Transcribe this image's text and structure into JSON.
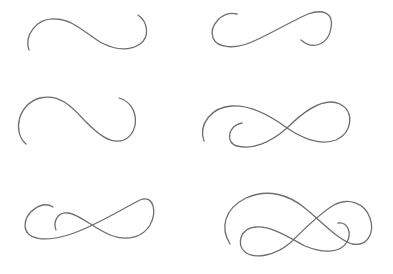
{
  "canvas": {
    "width": 393,
    "height": 274,
    "background": "#ffffff",
    "stroke_color": "#6e6e6e",
    "stroke_width": 1.3
  },
  "flourishes": [
    {
      "name": "flourish-1-s-curve",
      "paths": [
        "M29,50 C24,36 36,18 55,19 C72,19 84,32 100,42 C115,50 128,52 140,44 C150,37 148,22 138,15"
      ]
    },
    {
      "name": "flourish-2-open-loop",
      "paths": [
        "M237,14 C222,10 209,26 213,38 C217,48 235,50 254,41 C272,33 290,22 308,14 C322,9 334,12 331,28 C329,42 315,52 301,40"
      ]
    },
    {
      "name": "flourish-3-wide-s-curve",
      "paths": [
        "M26,144 C12,132 18,104 40,98 C60,93 73,108 85,121 C97,133 110,145 124,140 C140,133 140,104 119,98"
      ]
    },
    {
      "name": "flourish-4-infinity-with-curl",
      "paths": [
        "M204,141 C198,124 212,107 232,106 C252,105 272,117 287,128 C302,138 320,146 336,140 C352,133 355,112 340,104 C325,97 305,110 287,128 C270,143 252,150 237,146 C225,143 228,125 242,123"
      ]
    },
    {
      "name": "flourish-5-infinity-with-inner-curl",
      "paths": [
        "M53,207 C42,200 25,212 25,226 C26,240 45,242 68,235 C92,228 120,210 140,200 C154,194 157,212 150,225 C143,237 128,241 113,236 C95,230 80,214 68,213 C57,212 53,222 56,230"
      ]
    },
    {
      "name": "flourish-6-double-loop",
      "paths": [
        "M230,244 C220,228 224,209 246,198 C268,188 290,195 306,209 C322,222 336,238 352,244 C368,247 375,232 370,218 C365,203 348,197 334,205 C317,215 302,232 290,243 C276,255 255,260 245,252 C236,245 240,228 256,227 C272,226 290,238 305,246 C322,253 340,254 347,242 C352,233 348,222 338,223"
      ]
    }
  ]
}
